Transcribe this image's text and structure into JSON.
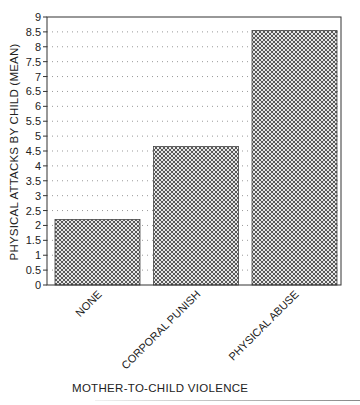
{
  "chart_data": {
    "type": "bar",
    "title": "",
    "xlabel": "MOTHER-TO-CHILD VIOLENCE",
    "ylabel": "PHYSICAL ATTACKS BY CHILD (MEAN)",
    "categories": [
      "NONE",
      "CORPORAL PUNISH",
      "PHYSICAL ABUSE"
    ],
    "values": [
      2.2,
      4.65,
      8.55
    ],
    "ylim": [
      0,
      9
    ],
    "yticks": [
      "0",
      "0.5",
      "1",
      "1.5",
      "2",
      "2.5",
      "3",
      "3.5",
      "4",
      "4.5",
      "5",
      "5.5",
      "6",
      "6.5",
      "7",
      "7.5",
      "8",
      "8.5",
      "9"
    ],
    "grid": "horizontal dotted",
    "legend": "none",
    "bar_fill": "crosshatch",
    "colors": {
      "bar_hatch": "#555555",
      "axis": "#333333",
      "grid": "#999999"
    }
  }
}
